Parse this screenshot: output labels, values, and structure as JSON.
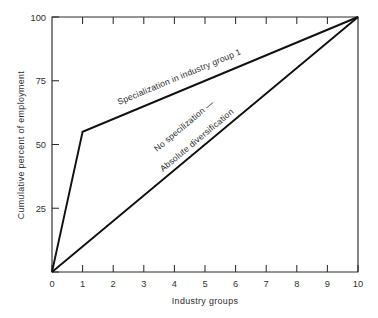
{
  "chart_data": {
    "type": "line",
    "title": "",
    "xlabel": "Industry groups",
    "ylabel": "Cumulative percent of employment",
    "xlim": [
      0,
      10
    ],
    "ylim": [
      0,
      100
    ],
    "x_ticks": [
      "0",
      "1",
      "2",
      "3",
      "4",
      "5",
      "6",
      "7",
      "8",
      "9",
      "10"
    ],
    "y_ticks": [
      "0",
      "25",
      "50",
      "75",
      "100"
    ],
    "grid": false,
    "legend": "inline-annotations",
    "series": [
      {
        "name": "Specialization in industry group 1",
        "x": [
          0,
          1,
          10
        ],
        "values": [
          0,
          55,
          100
        ]
      },
      {
        "name": "No specilization — Absolute diversification",
        "x": [
          0,
          10
        ],
        "values": [
          0,
          100
        ]
      }
    ],
    "annotations": [
      {
        "text": "Specialization in industry group 1",
        "attached_to": "Specialization in industry group 1"
      },
      {
        "text": "No specilization —",
        "attached_to": "No specilization — Absolute diversification"
      },
      {
        "text": "Absolute diversification",
        "attached_to": "No specilization — Absolute diversification"
      }
    ],
    "colors": {
      "background": "#ffffff",
      "line": "#111111",
      "axis": "#2b2b2b",
      "text": "#2e2e2e"
    }
  }
}
